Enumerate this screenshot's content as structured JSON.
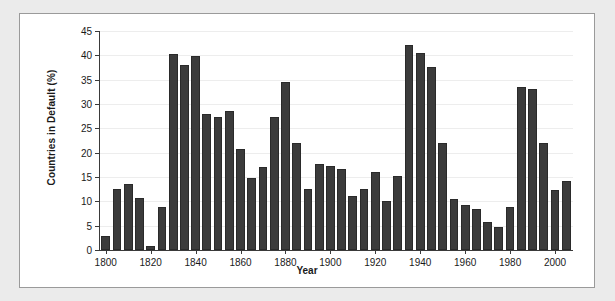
{
  "chart_data": {
    "type": "bar",
    "title": "",
    "xlabel": "Year",
    "ylabel": "Countries in Default (%)",
    "xlim": [
      1797,
      2008
    ],
    "ylim": [
      0,
      45
    ],
    "grid": true,
    "legend": null,
    "bar_color": "#3b3b3b",
    "panel_color": "#ffffff",
    "background_color": "#ebebeb",
    "ytick_labels": [
      "0",
      "5",
      "10",
      "15",
      "20",
      "25",
      "30",
      "35",
      "40",
      "45"
    ],
    "yticks": [
      0,
      5,
      10,
      15,
      20,
      25,
      30,
      35,
      40,
      45
    ],
    "xtick_labels": [
      "1800",
      "1820",
      "1840",
      "1860",
      "1880",
      "1900",
      "1920",
      "1940",
      "1960",
      "1980",
      "2000"
    ],
    "xticks": [
      1800,
      1820,
      1840,
      1860,
      1880,
      1900,
      1920,
      1940,
      1960,
      1980,
      2000
    ],
    "categories": [
      1800,
      1805,
      1810,
      1815,
      1820,
      1825,
      1830,
      1835,
      1840,
      1845,
      1850,
      1855,
      1860,
      1865,
      1870,
      1875,
      1880,
      1885,
      1890,
      1895,
      1900,
      1905,
      1910,
      1915,
      1920,
      1925,
      1930,
      1935,
      1940,
      1945,
      1950,
      1955,
      1960,
      1965,
      1970,
      1975,
      1980,
      1985,
      1990,
      1995,
      2000,
      2005
    ],
    "values": [
      2.8,
      12.5,
      13.6,
      10.6,
      0.9,
      8.8,
      40.3,
      38.1,
      39.8,
      27.9,
      27.4,
      28.5,
      20.7,
      14.9,
      17.1,
      27.3,
      34.6,
      22.0,
      12.5,
      17.7,
      17.2,
      16.6,
      11.2,
      12.5,
      16.0,
      10.1,
      15.3,
      42.2,
      40.4,
      37.6,
      22.0,
      10.4,
      9.3,
      8.4,
      5.7,
      4.8,
      8.8,
      33.4,
      33.0,
      22.0,
      12.3,
      14.1
    ]
  }
}
